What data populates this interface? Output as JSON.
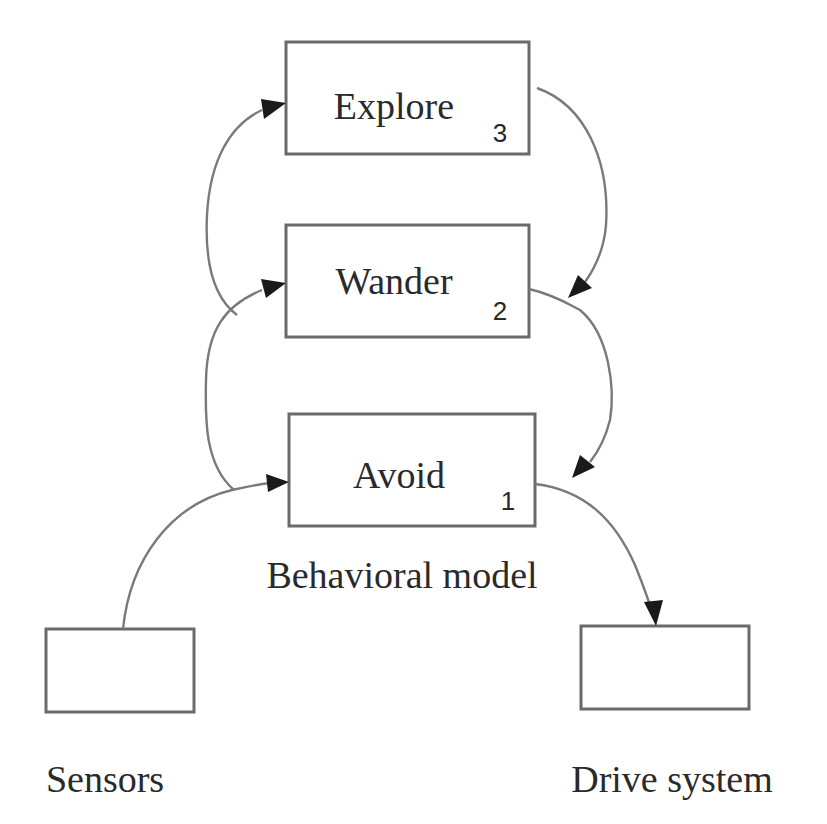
{
  "diagram": {
    "caption": "Behavioral model",
    "layers": [
      {
        "id": "explore",
        "label": "Explore",
        "level": "3"
      },
      {
        "id": "wander",
        "label": "Wander",
        "level": "2"
      },
      {
        "id": "avoid",
        "label": "Avoid",
        "level": "1"
      }
    ],
    "io": [
      {
        "id": "sensors",
        "label": "Sensors",
        "role": "input"
      },
      {
        "id": "drive",
        "label": "Drive system",
        "role": "output"
      }
    ],
    "edges": [
      {
        "from": "sensors",
        "to": "avoid"
      },
      {
        "from": "sensors",
        "to": "wander"
      },
      {
        "from": "sensors",
        "to": "explore"
      },
      {
        "from": "explore",
        "to": "wander-output"
      },
      {
        "from": "wander",
        "to": "avoid-output"
      },
      {
        "from": "avoid",
        "to": "drive"
      }
    ],
    "colors": {
      "box_stroke": "#6a6a6a",
      "edge": "#7a7a7a",
      "arrowhead": "#1a1a1a",
      "text": "#2a2a2a"
    }
  }
}
